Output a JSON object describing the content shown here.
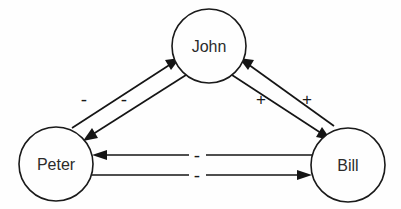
{
  "diagram": {
    "type": "causal-loop-diagram",
    "background_color": "#fefefe",
    "stroke_color": "#151515",
    "text_color": "#2b2b2b",
    "nodes": [
      {
        "id": "john",
        "label": "John",
        "cx": 209,
        "cy": 46,
        "r": 37
      },
      {
        "id": "peter",
        "label": "Peter",
        "cx": 56,
        "cy": 164,
        "r": 37
      },
      {
        "id": "bill",
        "label": "Bill",
        "cx": 348,
        "cy": 165,
        "r": 37
      }
    ],
    "edges": [
      {
        "id": "peter-to-john",
        "from": "peter",
        "to": "john",
        "sign": "-",
        "direction": "up-right"
      },
      {
        "id": "john-to-peter",
        "from": "john",
        "to": "peter",
        "sign": "-",
        "direction": "down-left"
      },
      {
        "id": "bill-to-john",
        "from": "bill",
        "to": "john",
        "sign": "+",
        "direction": "up-left"
      },
      {
        "id": "john-to-bill",
        "from": "john",
        "to": "bill",
        "sign": "+",
        "direction": "down-right"
      },
      {
        "id": "bill-to-peter",
        "from": "bill",
        "to": "peter",
        "sign": "-",
        "direction": "left"
      },
      {
        "id": "peter-to-bill",
        "from": "peter",
        "to": "bill",
        "sign": "-",
        "direction": "right"
      }
    ],
    "signs": {
      "peter_john_outer": "-",
      "peter_john_inner": "-",
      "john_bill_inner": "+",
      "john_bill_outer": "+",
      "peter_bill_top": "-",
      "peter_bill_bottom": "-"
    }
  }
}
